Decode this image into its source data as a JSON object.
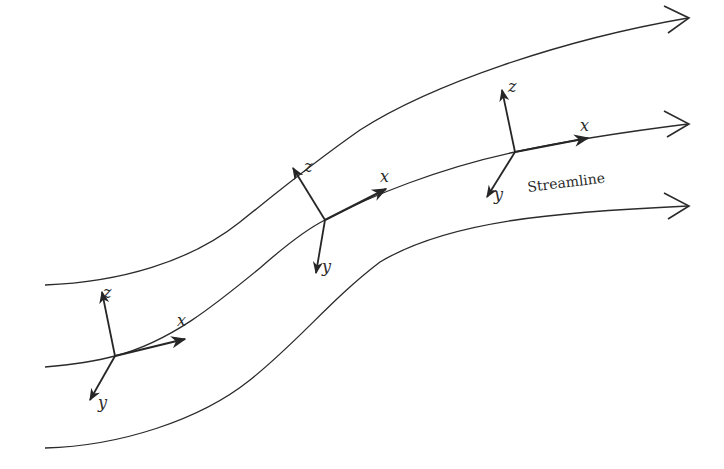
{
  "figure": {
    "type": "streamline coordinate frames",
    "streamline_label": "Streamline",
    "axis_labels": {
      "x": "x",
      "y": "y",
      "z": "z"
    },
    "frames": [
      {
        "id": 1,
        "x_label": "x",
        "y_label": "y",
        "z_label": "z"
      },
      {
        "id": 2,
        "x_label": "x",
        "y_label": "y",
        "z_label": "z"
      },
      {
        "id": 3,
        "x_label": "x",
        "y_label": "y",
        "z_label": "z"
      }
    ],
    "streamline_count": 3,
    "colors": {
      "line": "#2b2b2b",
      "background": "#ffffff"
    }
  }
}
